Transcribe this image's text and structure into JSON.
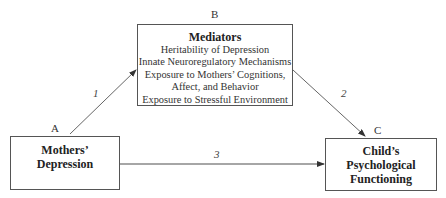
{
  "nodes": {
    "a": {
      "letter": "A",
      "title_line1": "Mothers’",
      "title_line2": "Depression"
    },
    "b": {
      "letter": "B",
      "title": "Mediators",
      "items": [
        "Heritability of Depression",
        "Innate Neuroregulatory Mechanisms",
        "Exposure to Mothers’ Cognitions,",
        "Affect, and Behavior",
        "Exposure to Stressful Environment"
      ]
    },
    "c": {
      "letter": "C",
      "title_line1": "Child’s",
      "title_line2": "Psychological",
      "title_line3": "Functioning"
    }
  },
  "paths": [
    {
      "label": "1",
      "from": "A",
      "to": "B"
    },
    {
      "label": "2",
      "from": "B",
      "to": "C"
    },
    {
      "label": "3",
      "from": "A",
      "to": "C"
    }
  ],
  "colors": {
    "line": "#555555",
    "text": "#222222"
  }
}
